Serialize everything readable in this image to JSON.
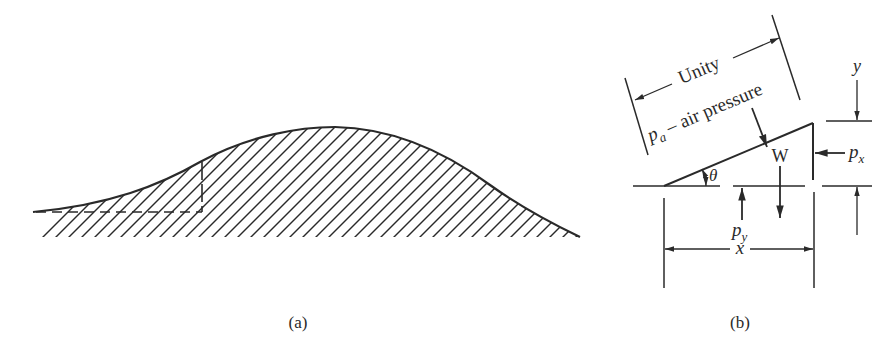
{
  "figure_a": {
    "caption": "(a)",
    "description": "Hill-shaped hatched profile with dashed base segment and vertical cut"
  },
  "figure_b": {
    "caption": "(b)",
    "labels": {
      "unity": "Unity",
      "pressure_symbol": "p",
      "pressure_subscript": "a",
      "pressure_text": " – air pressure",
      "weight": "W",
      "angle": "θ",
      "px_symbol": "p",
      "px_subscript": "x",
      "py_symbol": "p",
      "py_subscript": "y",
      "x_dim": "x",
      "y_dim": "y"
    }
  },
  "colors": {
    "ink": "#2a2a2a",
    "background": "#ffffff"
  }
}
